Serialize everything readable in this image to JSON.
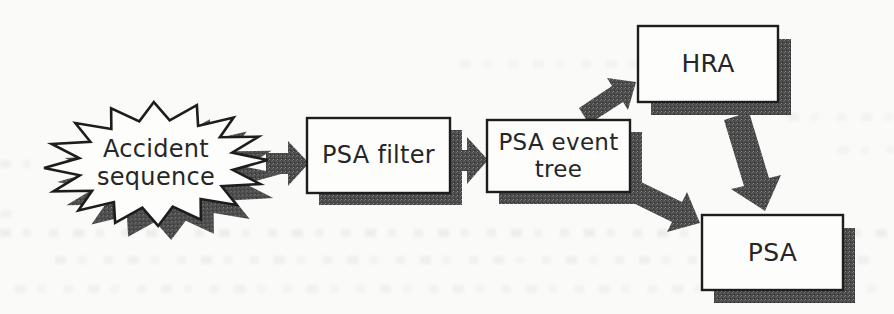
{
  "figure": {
    "type": "flow-diagram",
    "colors": {
      "paper": "#fafaf8",
      "ink": "#1d1d1d",
      "box_fill": "#fdfdfc",
      "shadow_gray": "#4a4a4a"
    },
    "nodes": {
      "accident_sequence": {
        "shape": "starburst",
        "line1": "Accident",
        "line2": "sequence"
      },
      "psa_filter": {
        "shape": "rectangle",
        "label": "PSA filter"
      },
      "psa_event_tree": {
        "shape": "rectangle",
        "line1": "PSA event",
        "line2": "tree"
      },
      "hra": {
        "shape": "rectangle",
        "label": "HRA"
      },
      "psa": {
        "shape": "rectangle",
        "label": "PSA"
      }
    },
    "edges": [
      {
        "from": "accident_sequence",
        "to": "psa_filter"
      },
      {
        "from": "psa_filter",
        "to": "psa_event_tree"
      },
      {
        "from": "psa_event_tree",
        "to": "hra"
      },
      {
        "from": "hra",
        "to": "psa"
      },
      {
        "from": "psa_event_tree",
        "to": "psa"
      }
    ]
  }
}
